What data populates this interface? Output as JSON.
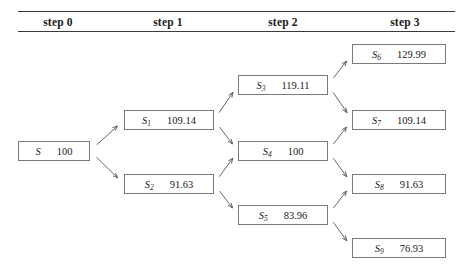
{
  "figure": {
    "type": "binomial-tree-diagram",
    "headers": [
      {
        "label": "step 0",
        "center_x": 58
      },
      {
        "label": "step 1",
        "center_x": 168
      },
      {
        "label": "step 2",
        "center_x": 283
      },
      {
        "label": "step 3",
        "center_x": 405
      }
    ],
    "nodes": [
      {
        "id": "S",
        "symbol": "S",
        "sub": "",
        "value": "100",
        "step": 0,
        "x": 18,
        "y": 141,
        "w": 72
      },
      {
        "id": "S1",
        "symbol": "S",
        "sub": "1",
        "value": "109.14",
        "step": 1,
        "x": 124,
        "y": 110,
        "w": 90
      },
      {
        "id": "S2",
        "symbol": "S",
        "sub": "2",
        "value": "91.63",
        "step": 1,
        "x": 124,
        "y": 174,
        "w": 90
      },
      {
        "id": "S3",
        "symbol": "S",
        "sub": "3",
        "value": "119.11",
        "step": 2,
        "x": 238,
        "y": 75,
        "w": 90
      },
      {
        "id": "S4",
        "symbol": "S",
        "sub": "4",
        "value": "100",
        "step": 2,
        "x": 238,
        "y": 141,
        "w": 90
      },
      {
        "id": "S5",
        "symbol": "S",
        "sub": "5",
        "value": "83.96",
        "step": 2,
        "x": 238,
        "y": 205,
        "w": 90
      },
      {
        "id": "S6",
        "symbol": "S",
        "sub": "6",
        "value": "129.99",
        "step": 3,
        "x": 352,
        "y": 44,
        "w": 94
      },
      {
        "id": "S7",
        "symbol": "S",
        "sub": "7",
        "value": "109.14",
        "step": 3,
        "x": 352,
        "y": 110,
        "w": 94
      },
      {
        "id": "S8",
        "symbol": "S",
        "sub": "8",
        "value": "91.63",
        "step": 3,
        "x": 352,
        "y": 174,
        "w": 94
      },
      {
        "id": "S9",
        "symbol": "S",
        "sub": "9",
        "value": "76.93",
        "step": 3,
        "x": 352,
        "y": 238,
        "w": 94
      }
    ],
    "edges": [
      {
        "from": "S",
        "to": "S1",
        "direction": "up"
      },
      {
        "from": "S",
        "to": "S2",
        "direction": "down"
      },
      {
        "from": "S1",
        "to": "S3",
        "direction": "up"
      },
      {
        "from": "S1",
        "to": "S4",
        "direction": "down"
      },
      {
        "from": "S2",
        "to": "S4",
        "direction": "up"
      },
      {
        "from": "S2",
        "to": "S5",
        "direction": "down"
      },
      {
        "from": "S3",
        "to": "S6",
        "direction": "up"
      },
      {
        "from": "S3",
        "to": "S7",
        "direction": "down"
      },
      {
        "from": "S4",
        "to": "S7",
        "direction": "up"
      },
      {
        "from": "S4",
        "to": "S8",
        "direction": "down"
      },
      {
        "from": "S5",
        "to": "S8",
        "direction": "up"
      },
      {
        "from": "S5",
        "to": "S9",
        "direction": "down"
      }
    ],
    "colors": {
      "rule": "#3a3a3a",
      "box_border": "#7a7a7a",
      "arrow": "#555555",
      "text": "#1a1a1a",
      "background": "#ffffff"
    }
  }
}
